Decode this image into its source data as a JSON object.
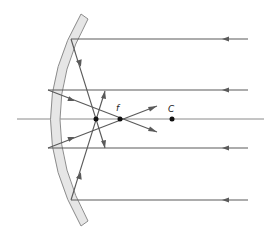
{
  "diagram": {
    "labels": {
      "focal_point": "f",
      "center_of_curvature": "C"
    },
    "points": [
      {
        "id": "marginal-focus",
        "label": ""
      },
      {
        "id": "focal-point",
        "label": "f"
      },
      {
        "id": "center-of-curvature",
        "label": "C"
      }
    ],
    "rays": [
      {
        "id": "ray-1",
        "type": "marginal",
        "position": "top"
      },
      {
        "id": "ray-2",
        "type": "paraxial",
        "position": "upper"
      },
      {
        "id": "ray-3",
        "type": "paraxial",
        "position": "lower"
      },
      {
        "id": "ray-4",
        "type": "marginal",
        "position": "bottom"
      }
    ],
    "colors": {
      "ray": "#5a5a5a",
      "mirror_fill": "#e6e6e6",
      "mirror_edge": "#8c8c8c",
      "axis": "#8a8a8a",
      "point": "#111111"
    }
  }
}
